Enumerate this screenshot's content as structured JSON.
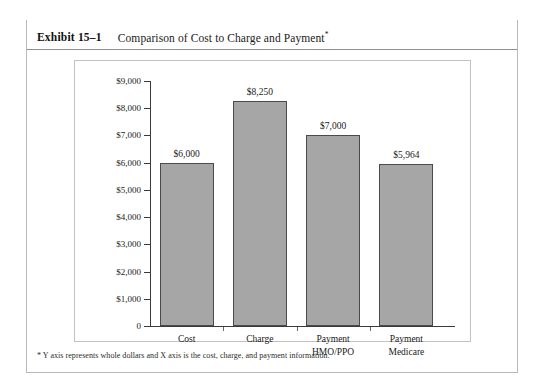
{
  "exhibit": {
    "number": "Exhibit 15–1",
    "title": "Comparison of Cost to Charge and Payment",
    "title_marker": "*",
    "footnote": "* Y axis represents whole dollars and X axis is the cost, charge, and payment information."
  },
  "colors": {
    "bar_fill": "#a6a6a6",
    "bar_border": "#4a4a4a",
    "axis": "#3a3a3a",
    "frame_rule": "#1a1a1a",
    "frame_border": "#b9b9b9",
    "chart_box_border": "#c2c2c2"
  },
  "chart_data": {
    "type": "bar",
    "title": "Comparison of Cost to Charge and Payment",
    "categories": [
      "Cost",
      "Charge",
      "Payment HMO/PPO",
      "Payment Medicare"
    ],
    "category_lines": [
      [
        "Cost"
      ],
      [
        "Charge"
      ],
      [
        "Payment",
        "HMO/PPO"
      ],
      [
        "Payment",
        "Medicare"
      ]
    ],
    "values": [
      6000,
      8250,
      7000,
      5964
    ],
    "value_labels": [
      "$6,000",
      "$8,250",
      "$7,000",
      "$5,964"
    ],
    "xlabel": "",
    "ylabel": "",
    "ylim": [
      0,
      9000
    ],
    "ytick_values": [
      0,
      1000,
      2000,
      3000,
      4000,
      5000,
      6000,
      7000,
      8000,
      9000
    ],
    "ytick_labels": [
      "0",
      "$1,000",
      "$2,000",
      "$3,000",
      "$4,000",
      "$5,000",
      "$6,000",
      "$7,000",
      "$8,000",
      "$9,000"
    ],
    "grid": false,
    "legend": false
  }
}
